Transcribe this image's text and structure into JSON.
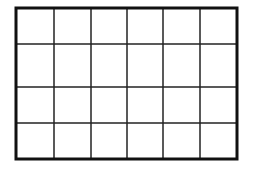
{
  "grid": {
    "rows": 4,
    "columns": 6,
    "x": 16,
    "y": 8,
    "width": 221,
    "height": 151,
    "border_color": "#111111",
    "border_width": 3,
    "line_color": "#222222",
    "line_width": 1.5,
    "cell_fill": "#ffffff",
    "column_lines_x": [
      54,
      91,
      127,
      163,
      200
    ],
    "row_lines_y": [
      44,
      87,
      123
    ]
  }
}
